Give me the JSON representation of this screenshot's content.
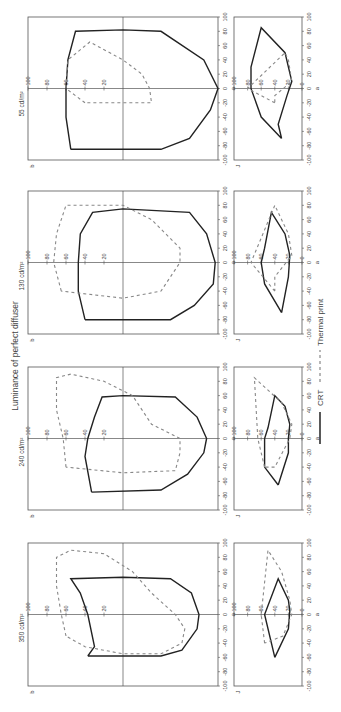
{
  "title": "Luminance of perfect diffuser",
  "legend": [
    {
      "label": "CRT",
      "style": "solid",
      "color": "#222222"
    },
    {
      "label": "Thermal print",
      "style": "dashed",
      "color": "#888888"
    }
  ],
  "chart_data": [
    {
      "type": "line",
      "panel": "350 cd/m2 - a vs b",
      "title": "350 cd/m²",
      "xlabel": "a",
      "ylabel": "b",
      "xlim": [
        -100,
        100
      ],
      "ylim": [
        -100,
        100
      ],
      "series": [
        {
          "name": "CRT",
          "points": [
            [
              -58,
              37
            ],
            [
              -45,
              30
            ],
            [
              0,
              37
            ],
            [
              30,
              45
            ],
            [
              50,
              55
            ],
            [
              52,
              0
            ],
            [
              50,
              -50
            ],
            [
              30,
              -72
            ],
            [
              0,
              -80
            ],
            [
              -20,
              -78
            ],
            [
              -50,
              -62
            ],
            [
              -58,
              -40
            ],
            [
              -58,
              37
            ]
          ]
        },
        {
          "name": "Thermal print",
          "points": [
            [
              -30,
              60
            ],
            [
              0,
              65
            ],
            [
              40,
              70
            ],
            [
              80,
              70
            ],
            [
              90,
              55
            ],
            [
              85,
              20
            ],
            [
              60,
              -10
            ],
            [
              30,
              -30
            ],
            [
              0,
              -55
            ],
            [
              -20,
              -65
            ],
            [
              -40,
              -62
            ],
            [
              -55,
              -40
            ],
            [
              -55,
              0
            ],
            [
              -45,
              40
            ],
            [
              -30,
              60
            ]
          ]
        }
      ]
    },
    {
      "type": "line",
      "panel": "350 cd/m2 - a vs J",
      "xlabel": "a",
      "ylabel": "J",
      "xlim": [
        -100,
        100
      ],
      "ylim": [
        0,
        100
      ],
      "series": [
        {
          "name": "CRT",
          "points": [
            [
              -60,
              40
            ],
            [
              0,
              55
            ],
            [
              50,
              35
            ],
            [
              20,
              20
            ],
            [
              5,
              18
            ],
            [
              -20,
              20
            ],
            [
              -60,
              40
            ]
          ]
        },
        {
          "name": "Thermal print",
          "points": [
            [
              -40,
              55
            ],
            [
              0,
              60
            ],
            [
              90,
              50
            ],
            [
              60,
              30
            ],
            [
              20,
              18
            ],
            [
              0,
              15
            ],
            [
              -30,
              28
            ],
            [
              -40,
              55
            ]
          ]
        }
      ]
    },
    {
      "type": "line",
      "panel": "240 cd/m2 - a vs b",
      "title": "240 cd/m²",
      "xlabel": "a",
      "ylabel": "b",
      "xlim": [
        -100,
        100
      ],
      "ylim": [
        -100,
        100
      ],
      "series": [
        {
          "name": "CRT",
          "points": [
            [
              -75,
              33
            ],
            [
              -25,
              40
            ],
            [
              0,
              37
            ],
            [
              30,
              30
            ],
            [
              58,
              22
            ],
            [
              60,
              0
            ],
            [
              58,
              -55
            ],
            [
              30,
              -78
            ],
            [
              0,
              -88
            ],
            [
              -20,
              -85
            ],
            [
              -50,
              -68
            ],
            [
              -72,
              -40
            ],
            [
              -75,
              33
            ]
          ]
        },
        {
          "name": "Thermal print",
          "points": [
            [
              -40,
              60
            ],
            [
              0,
              63
            ],
            [
              40,
              70
            ],
            [
              85,
              70
            ],
            [
              90,
              55
            ],
            [
              80,
              20
            ],
            [
              60,
              -10
            ],
            [
              20,
              -30
            ],
            [
              0,
              -60
            ],
            [
              -20,
              -60
            ],
            [
              -45,
              -55
            ],
            [
              -48,
              0
            ],
            [
              -40,
              60
            ]
          ]
        }
      ]
    },
    {
      "type": "line",
      "panel": "240 cd/m2 - a vs J",
      "xlabel": "a",
      "ylabel": "J",
      "xlim": [
        -100,
        100
      ],
      "ylim": [
        0,
        100
      ],
      "series": [
        {
          "name": "CRT",
          "points": [
            [
              -65,
              35
            ],
            [
              -40,
              55
            ],
            [
              0,
              55
            ],
            [
              15,
              50
            ],
            [
              60,
              40
            ],
            [
              45,
              25
            ],
            [
              20,
              18
            ],
            [
              0,
              20
            ],
            [
              -20,
              20
            ],
            [
              -65,
              35
            ]
          ]
        },
        {
          "name": "Thermal print",
          "points": [
            [
              -40,
              55
            ],
            [
              0,
              65
            ],
            [
              85,
              70
            ],
            [
              50,
              30
            ],
            [
              20,
              15
            ],
            [
              0,
              18
            ],
            [
              -40,
              40
            ],
            [
              -40,
              55
            ]
          ]
        }
      ]
    },
    {
      "type": "line",
      "panel": "130 cd/m2 - a vs b",
      "title": "130 cd/m²",
      "xlabel": "a",
      "ylabel": "b",
      "xlim": [
        -100,
        100
      ],
      "ylim": [
        -100,
        100
      ],
      "series": [
        {
          "name": "CRT",
          "points": [
            [
              -80,
              40
            ],
            [
              -40,
              47
            ],
            [
              0,
              47
            ],
            [
              40,
              45
            ],
            [
              70,
              32
            ],
            [
              75,
              0
            ],
            [
              70,
              -70
            ],
            [
              40,
              -88
            ],
            [
              0,
              -97
            ],
            [
              -30,
              -95
            ],
            [
              -60,
              -75
            ],
            [
              -80,
              -50
            ],
            [
              -80,
              40
            ]
          ]
        },
        {
          "name": "Thermal print",
          "points": [
            [
              -40,
              65
            ],
            [
              0,
              73
            ],
            [
              40,
              70
            ],
            [
              80,
              60
            ],
            [
              80,
              0
            ],
            [
              60,
              -30
            ],
            [
              20,
              -60
            ],
            [
              0,
              -60
            ],
            [
              -40,
              -40
            ],
            [
              -50,
              0
            ],
            [
              -40,
              65
            ]
          ]
        }
      ]
    },
    {
      "type": "line",
      "panel": "130 cd/m2 - a vs J",
      "xlabel": "a",
      "ylabel": "J",
      "xlim": [
        -100,
        100
      ],
      "ylim": [
        0,
        100
      ],
      "series": [
        {
          "name": "CRT",
          "points": [
            [
              -70,
              30
            ],
            [
              -30,
              55
            ],
            [
              0,
              60
            ],
            [
              20,
              55
            ],
            [
              70,
              45
            ],
            [
              40,
              25
            ],
            [
              10,
              18
            ],
            [
              -20,
              20
            ],
            [
              -70,
              30
            ]
          ]
        },
        {
          "name": "Thermal print",
          "points": [
            [
              -40,
              40
            ],
            [
              0,
              75
            ],
            [
              80,
              40
            ],
            [
              40,
              20
            ],
            [
              10,
              15
            ],
            [
              -20,
              40
            ],
            [
              -40,
              40
            ]
          ]
        }
      ]
    },
    {
      "type": "line",
      "panel": "55 cd/m2 - a vs b",
      "title": "55 cd/m²",
      "xlabel": "a",
      "ylabel": "b",
      "xlim": [
        -100,
        100
      ],
      "ylim": [
        -100,
        100
      ],
      "series": [
        {
          "name": "CRT",
          "points": [
            [
              -85,
              55
            ],
            [
              -40,
              60
            ],
            [
              0,
              60
            ],
            [
              40,
              58
            ],
            [
              80,
              50
            ],
            [
              82,
              0
            ],
            [
              80,
              -40
            ],
            [
              40,
              -85
            ],
            [
              0,
              -100
            ],
            [
              -30,
              -92
            ],
            [
              -70,
              -70
            ],
            [
              -85,
              -40
            ],
            [
              -85,
              55
            ]
          ]
        },
        {
          "name": "Thermal print",
          "points": [
            [
              -20,
              40
            ],
            [
              0,
              60
            ],
            [
              40,
              58
            ],
            [
              65,
              35
            ],
            [
              40,
              0
            ],
            [
              20,
              -20
            ],
            [
              0,
              -28
            ],
            [
              -20,
              -30
            ],
            [
              -20,
              0
            ],
            [
              -20,
              40
            ]
          ]
        }
      ]
    },
    {
      "type": "line",
      "panel": "55 cd/m2 - a vs J",
      "xlabel": "a",
      "ylabel": "J",
      "xlim": [
        -100,
        100
      ],
      "ylim": [
        0,
        100
      ],
      "series": [
        {
          "name": "CRT",
          "points": [
            [
              -70,
              30
            ],
            [
              -40,
              60
            ],
            [
              0,
              75
            ],
            [
              30,
              75
            ],
            [
              85,
              60
            ],
            [
              50,
              25
            ],
            [
              10,
              15
            ],
            [
              -10,
              22
            ],
            [
              -50,
              35
            ],
            [
              -70,
              30
            ]
          ]
        },
        {
          "name": "Thermal print",
          "points": [
            [
              -20,
              40
            ],
            [
              0,
              80
            ],
            [
              50,
              25
            ],
            [
              40,
              20
            ],
            [
              10,
              15
            ],
            [
              -10,
              40
            ],
            [
              -20,
              40
            ]
          ]
        }
      ]
    }
  ]
}
